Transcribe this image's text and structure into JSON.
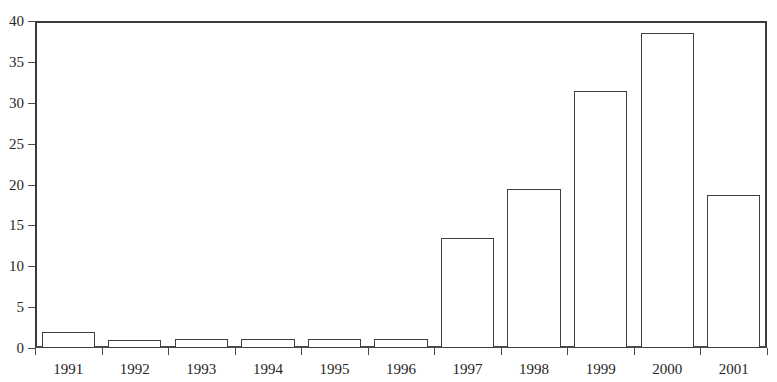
{
  "chart_data": {
    "type": "bar",
    "title": "",
    "subtitle": "",
    "xlabel": "",
    "ylabel": "",
    "categories": [
      "1991",
      "1992",
      "1993",
      "1994",
      "1995",
      "1996",
      "1997",
      "1998",
      "1999",
      "2000",
      "2001"
    ],
    "values": [
      2.0,
      1.0,
      1.1,
      1.1,
      1.1,
      1.1,
      13.5,
      19.5,
      31.5,
      38.5,
      18.7
    ],
    "series": [
      {
        "name": "",
        "values": [
          2.0,
          1.0,
          1.1,
          1.1,
          1.1,
          1.1,
          13.5,
          19.5,
          31.5,
          38.5,
          18.7
        ]
      }
    ],
    "ylim": [
      0,
      40
    ],
    "ytick_labels": [
      "0",
      "5",
      "10",
      "15",
      "20",
      "25",
      "30",
      "35",
      "40"
    ],
    "ytick_values": [
      0,
      5,
      10,
      15,
      20,
      25,
      30,
      35,
      40
    ],
    "grid": false,
    "legend": null,
    "legend_position": "none",
    "annotations": [],
    "colors": {
      "bar_fill": "#ffffff",
      "bar_stroke": "#3f3f3f",
      "axis": "#4a4a4a",
      "text": "#262626",
      "background": "#ffffff"
    }
  }
}
